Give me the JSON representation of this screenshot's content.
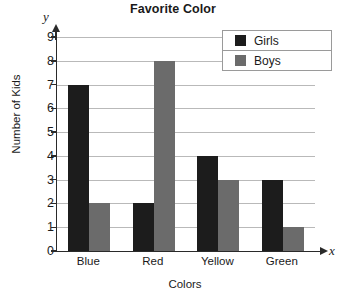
{
  "chart_data": {
    "type": "bar",
    "title": "Favorite Color",
    "xlabel": "Colors",
    "ylabel": "Number of Kids",
    "categories": [
      "Blue",
      "Red",
      "Yellow",
      "Green"
    ],
    "series": [
      {
        "name": "Girls",
        "values": [
          7,
          2,
          4,
          3
        ],
        "color": "#1c1c1c"
      },
      {
        "name": "Boys",
        "values": [
          2,
          8,
          3,
          1
        ],
        "color": "#6b6b6b"
      }
    ],
    "ylim": [
      0,
      9
    ],
    "yticks": [
      0,
      1,
      2,
      3,
      4,
      5,
      6,
      7,
      8,
      9
    ],
    "grid": true,
    "legend_position": "top-right",
    "axis_letters": {
      "x": "x",
      "y": "y"
    }
  }
}
